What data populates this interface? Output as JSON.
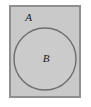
{
  "diagram": {
    "kind": "euler-diagram",
    "canvas": {
      "width": 91,
      "height": 107,
      "background_color": "#ffffff"
    },
    "outer_set": {
      "name": "outer-set-rectangle",
      "label": "A",
      "shape": "rectangle",
      "x": 10,
      "y": 6,
      "width": 70,
      "height": 91,
      "fill_color": "#c9c9c9",
      "stroke_color": "#8f8f8f",
      "stroke_width": 2,
      "label_x": 28.5,
      "label_y": 18,
      "label_font_size": 11
    },
    "inner_set": {
      "name": "inner-set-circle",
      "label": "B",
      "shape": "circle",
      "cx": 45,
      "cy": 59,
      "r": 31,
      "fill_color": "#cbcbcb",
      "stroke_color": "#6e6e6e",
      "stroke_width": 1.4,
      "label_x": 46,
      "label_y": 59.5,
      "label_font_size": 11
    }
  }
}
